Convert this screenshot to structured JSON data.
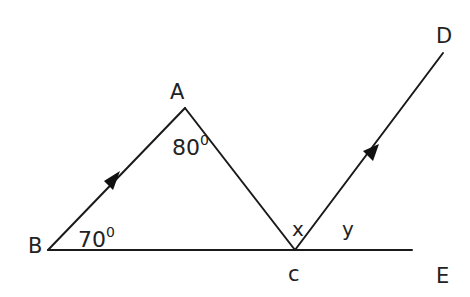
{
  "figure": {
    "points": {
      "A": "A",
      "B": "B",
      "C": "c",
      "D": "D",
      "E": "E"
    },
    "angles": {
      "angle_A": {
        "value": "80",
        "unit": "0"
      },
      "angle_B": {
        "value": "70",
        "unit": "0"
      },
      "angle_x": "x",
      "angle_y": "y"
    },
    "segments": [
      "BA",
      "AC",
      "BE",
      "CD"
    ],
    "parallel_marks": [
      "BA",
      "CD"
    ]
  }
}
